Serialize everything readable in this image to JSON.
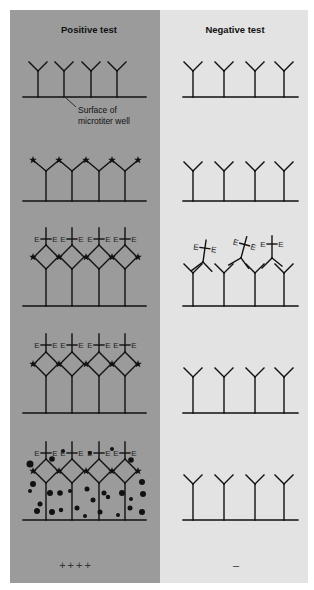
{
  "diagram": {
    "colors": {
      "positive_bg": "#9b9b9b",
      "negative_bg": "#e3e3e3",
      "ink": "#111111"
    },
    "panels": [
      {
        "id": "positive",
        "title": "Positive test",
        "result": "++++"
      },
      {
        "id": "negative",
        "title": "Negative test",
        "result": "–"
      }
    ],
    "callout": {
      "line1": "Surface of",
      "line2": "microtiter well"
    },
    "enzyme_label": "E",
    "stages": [
      {
        "step": 1,
        "positive": "Capture antibodies bound to well surface",
        "negative": "Capture antibodies bound to well surface"
      },
      {
        "step": 2,
        "positive": "Antigen (stars) bound to antibodies",
        "negative": "No antigen bound"
      },
      {
        "step": 3,
        "positive": "Enzyme-linked antibodies bind antigen",
        "negative": "Enzyme-linked antibodies unbound, floating"
      },
      {
        "step": 4,
        "positive": "Enzyme-linked antibodies remain after wash",
        "negative": "Unbound antibodies washed away"
      },
      {
        "step": 5,
        "positive": "Substrate converted to colored product (dots)",
        "negative": "No color reaction"
      }
    ],
    "antibody_x": {
      "positive": [
        46,
        72,
        99,
        125
      ],
      "negative": [
        193,
        224,
        255,
        284
      ]
    },
    "stage_baselines": [
      97,
      201,
      306,
      413,
      520
    ]
  }
}
